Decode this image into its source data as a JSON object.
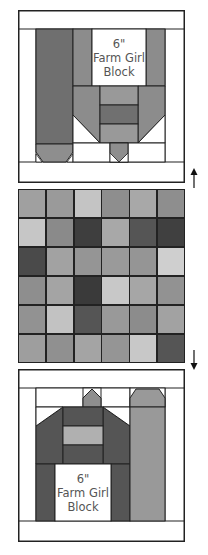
{
  "top_block": {
    "label_line1": "6\"",
    "label_line2": "Farm Girl",
    "label_line3": "Block",
    "colors": {
      "border": "#ffffff",
      "outline": "#222222",
      "silo": "#6f6f6f",
      "silo_base": "#8e8e8e",
      "barn_wall": "#8c8c8c",
      "barn_center": "#999999",
      "barn_stripe": "#707070",
      "chimney": "#8e8e8e"
    }
  },
  "grid": {
    "rows": 6,
    "cols": 6,
    "cells": [
      [
        "#a0a0a0",
        "#9a9a9a",
        "#c4c4c4",
        "#8e8e8e",
        "#a8a8a8",
        "#8e8e8e"
      ],
      [
        "#c6c6c6",
        "#8a8a8a",
        "#3e3e3e",
        "#a8a8a8",
        "#555555",
        "#404040"
      ],
      [
        "#4a4a4a",
        "#a2a2a2",
        "#959595",
        "#9a9a9a",
        "#959595",
        "#cfcfcf"
      ],
      [
        "#8e8e8e",
        "#a4a4a4",
        "#3a3a3a",
        "#c8c8c8",
        "#a6a6a6",
        "#929292"
      ],
      [
        "#929292",
        "#c2c2c2",
        "#555555",
        "#999999",
        "#8c8c8c",
        "#a2a2a2"
      ],
      [
        "#9e9e9e",
        "#909090",
        "#a4a4a4",
        "#959595",
        "#c8c8c8",
        "#555555"
      ]
    ]
  },
  "bottom_block": {
    "label_line1": "6\"",
    "label_line2": "Farm Girl",
    "label_line3": "Block",
    "colors": {
      "barn": "#555555",
      "barn_window": "#b0b0b0",
      "silo": "#999999",
      "chimney": "#8e8e8e"
    }
  },
  "arrows": {
    "up": "↑",
    "down": "↓"
  }
}
